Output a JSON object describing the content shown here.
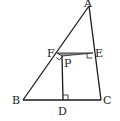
{
  "diagram": {
    "type": "geometry-figure",
    "points": {
      "A": {
        "label": "A",
        "x": 89,
        "y": 6
      },
      "B": {
        "label": "B",
        "x": 23,
        "y": 100
      },
      "C": {
        "label": "C",
        "x": 101,
        "y": 100
      },
      "D": {
        "label": "D",
        "x": 63,
        "y": 100
      },
      "E": {
        "label": "E",
        "x": 93,
        "y": 53
      },
      "F": {
        "label": "F",
        "x": 57,
        "y": 53
      },
      "P": {
        "label": "P",
        "x": 62,
        "y": 56
      }
    },
    "labels": {
      "A": "A",
      "B": "B",
      "C": "C",
      "D": "D",
      "E": "E",
      "F": "F",
      "P": "P"
    },
    "segments": [
      "AB",
      "AC",
      "BC",
      "PD",
      "PF",
      "PE",
      "FE"
    ],
    "right_angles": [
      "PFA",
      "PEA",
      "PDC"
    ],
    "shaded_region": "triangle FPE",
    "colors": {
      "stroke": "#1a1a1a",
      "shade": "#9a9a9a",
      "background": "#ffffff"
    }
  }
}
